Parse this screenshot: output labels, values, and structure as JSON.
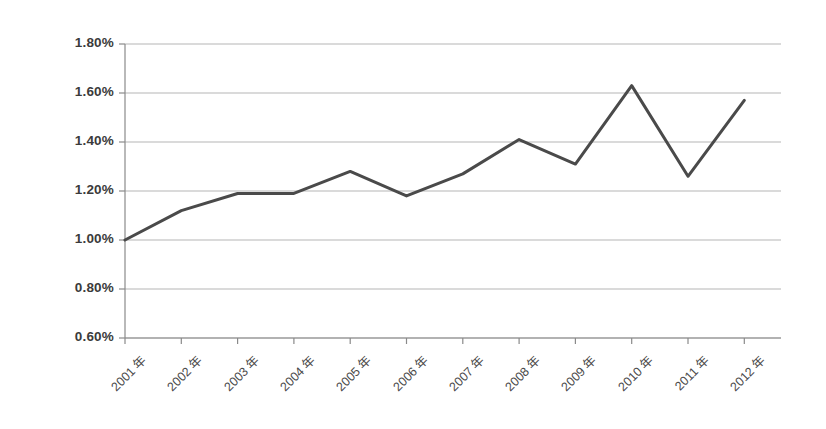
{
  "chart_data": {
    "type": "line",
    "title": "",
    "subtitle": "",
    "xlabel": "",
    "ylabel": "",
    "categories": [
      "2001 年",
      "2002 年",
      "2003 年",
      "2004 年",
      "2005 年",
      "2006 年",
      "2007 年",
      "2008 年",
      "2009 年",
      "2010 年",
      "2011 年",
      "2012 年"
    ],
    "values": [
      1.0,
      1.12,
      1.19,
      1.19,
      1.28,
      1.18,
      1.27,
      1.41,
      1.31,
      1.63,
      1.26,
      1.57
    ],
    "value_labels": [
      "1.00%",
      "1.12%",
      "1.19%",
      "1.19%",
      "1.28%",
      "1.18%",
      "1.27%",
      "1.41%",
      "1.31%",
      "1.63%",
      "1.26%",
      "1.57%"
    ],
    "unit": "%",
    "ylim": [
      0.6,
      1.8
    ],
    "ytick_values": [
      1.8,
      1.6,
      1.4,
      1.2,
      1.0,
      0.8,
      0.6
    ],
    "ytick_labels": [
      "1.80%",
      "1.60%",
      "1.40%",
      "1.20%",
      "1.00%",
      "0.80%",
      "0.60%"
    ],
    "grid": true,
    "grid_axis": "y",
    "legend": false,
    "legend_position": "none",
    "series": [
      {
        "name": "",
        "color": "#4a4a4a",
        "line_width": 3,
        "markers": false,
        "values": [
          1.0,
          1.12,
          1.19,
          1.19,
          1.28,
          1.18,
          1.27,
          1.41,
          1.31,
          1.63,
          1.26,
          1.57
        ]
      }
    ],
    "colors": {
      "line": "#4a4a4a",
      "grid": "#9d9d9d",
      "axis": "#8a8a8a",
      "text": "#3b3b3b",
      "background": "#ffffff"
    },
    "annotations": []
  }
}
